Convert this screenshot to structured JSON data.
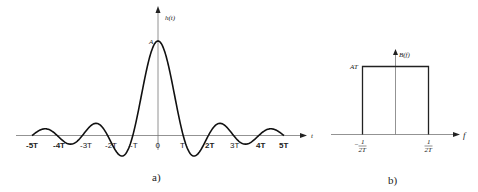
{
  "figure_a": {
    "caption": "a)",
    "y_axis_label": "h(t)",
    "x_axis_label": "t",
    "peak_label": "A",
    "tick_labels": [
      {
        "text": "-5T",
        "x": 31
      },
      {
        "text": "-4T",
        "x": 56
      },
      {
        "text": "-3T",
        "x": 82
      },
      {
        "text": "-2T",
        "x": 107
      },
      {
        "text": "-T",
        "x": 132
      },
      {
        "text": "0",
        "x": 158
      },
      {
        "text": "T",
        "x": 183
      },
      {
        "text": "2T",
        "x": 208
      },
      {
        "text": "3T",
        "x": 233
      },
      {
        "text": "4T",
        "x": 258
      },
      {
        "text": "5T",
        "x": 283
      }
    ]
  },
  "figure_b": {
    "caption": "b)",
    "y_axis_label": "B(f)",
    "x_axis_label": "f",
    "level_label": "AT",
    "left_tick": {
      "sign": "−",
      "num": "1",
      "den": "2T"
    },
    "right_tick": {
      "num": "1",
      "den": "2T"
    }
  },
  "chart_data": [
    {
      "type": "line",
      "title": "a)",
      "xlabel": "t",
      "ylabel": "h(t)",
      "function": "h(t) = A·sinc(t/T) = A·sin(πt/T)/(πt/T)",
      "x_ticks": [
        "-5T",
        "-4T",
        "-3T",
        "-2T",
        "-T",
        "0",
        "T",
        "2T",
        "3T",
        "4T",
        "5T"
      ],
      "x_range": [
        "-5T",
        "5T"
      ],
      "peak": {
        "x": "0",
        "y": "A"
      },
      "zero_crossings": [
        "-5T",
        "-4T",
        "-3T",
        "-2T",
        "-T",
        "T",
        "2T",
        "3T",
        "4T",
        "5T"
      ]
    },
    {
      "type": "line",
      "title": "b)",
      "xlabel": "f",
      "ylabel": "B(f)",
      "description": "Rectangular spectrum of height AT between -1/(2T) and 1/(2T)",
      "x_ticks": [
        "-1/(2T)",
        "1/(2T)"
      ],
      "y_ticks": [
        "AT"
      ],
      "points": [
        {
          "f": "-1/(2T)",
          "B": 0
        },
        {
          "f": "-1/(2T)",
          "B": "AT"
        },
        {
          "f": "1/(2T)",
          "B": "AT"
        },
        {
          "f": "1/(2T)",
          "B": 0
        }
      ]
    }
  ]
}
